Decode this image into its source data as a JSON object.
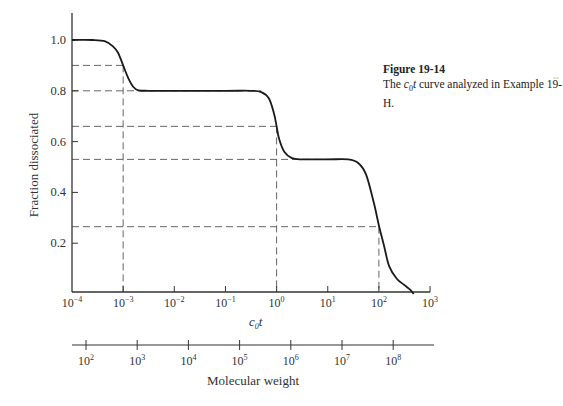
{
  "caption": {
    "figure_label": "Figure 19-14",
    "text_prefix": "The ",
    "text_var_c": "c",
    "text_var_sub": "0",
    "text_var_t": "t",
    "text_suffix": " curve analyzed in Example 19-H."
  },
  "chart_data": {
    "type": "line",
    "title": "The c0t curve analyzed in Example 19-H.",
    "figure_label": "Figure 19-14",
    "xlabel": "c0t",
    "ylabel": "Fraction dissociated",
    "xscale": "log",
    "xlim": [
      0.0001,
      1000
    ],
    "ylim": [
      0,
      1.1
    ],
    "x_ticks": [
      -4,
      -3,
      -2,
      -1,
      0,
      1,
      2,
      3
    ],
    "x_tick_labels": [
      "10^-4",
      "10^-3",
      "10^-2",
      "10^-1",
      "10^0",
      "10^1",
      "10^2",
      "10^3"
    ],
    "y_ticks": [
      0.2,
      0.4,
      0.6,
      0.8,
      1.0
    ],
    "y_tick_labels": [
      "0.2",
      "0.4",
      "0.6",
      "0.8",
      "1.0"
    ],
    "grid": false,
    "series": [
      {
        "name": "c0t curve",
        "log10_x": [
          -4.0,
          -3.6,
          -3.35,
          -3.2,
          -3.1,
          -3.0,
          -2.9,
          -2.8,
          -2.7,
          -2.5,
          -2.0,
          -1.0,
          -0.5,
          -0.3,
          -0.15,
          -0.05,
          0.0,
          0.05,
          0.15,
          0.3,
          0.5,
          1.0,
          1.4,
          1.6,
          1.75,
          1.9,
          2.0,
          2.1,
          2.2,
          2.35,
          2.5,
          2.62,
          2.68
        ],
        "y": [
          1.0,
          1.0,
          0.995,
          0.975,
          0.95,
          0.9,
          0.85,
          0.815,
          0.802,
          0.8,
          0.8,
          0.8,
          0.8,
          0.795,
          0.77,
          0.71,
          0.66,
          0.61,
          0.56,
          0.535,
          0.53,
          0.53,
          0.53,
          0.515,
          0.47,
          0.36,
          0.27,
          0.19,
          0.11,
          0.06,
          0.035,
          0.015,
          0.0
        ]
      }
    ],
    "reference_lines": [
      {
        "y": 0.9,
        "x_log10": -3,
        "label": "0.9 at 10^-3"
      },
      {
        "y": 0.8,
        "x_log10": null,
        "label": "0.8 plateau"
      },
      {
        "y": 0.66,
        "x_log10": 0,
        "label": "0.66 at 10^0"
      },
      {
        "y": 0.53,
        "x_log10": null,
        "label": "0.53 plateau"
      },
      {
        "y": 0.265,
        "x_log10": 2,
        "label": "0.265 at 10^2"
      }
    ],
    "vertical_reference_x_log10": [
      -3,
      0,
      2
    ],
    "secondary_axis": {
      "label": "Molecular weight",
      "tick_exponents": [
        2,
        3,
        4,
        5,
        6,
        7,
        8
      ],
      "tick_labels": [
        "10^2",
        "10^3",
        "10^4",
        "10^5",
        "10^6",
        "10^7",
        "10^8"
      ]
    }
  },
  "labels": {
    "xlabel_c": "c",
    "xlabel_sub": "0",
    "xlabel_t": "t",
    "ylabel": "Fraction dissociated",
    "secondary_label": "Molecular weight"
  }
}
